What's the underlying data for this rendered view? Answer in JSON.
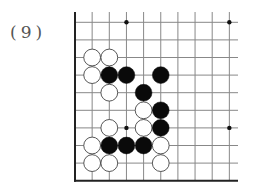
{
  "problem": {
    "label": "(9)"
  },
  "board": {
    "origin_x": 75,
    "origin_y": 22.3,
    "spacing_x": 17.15,
    "spacing_y": 17.6,
    "cols": 10,
    "rows": 10,
    "line_top": 12,
    "line_right": 238,
    "edges": [
      "left",
      "bottom"
    ],
    "line_color": "#888888",
    "edge_color": "#222222",
    "star_points": [
      {
        "col": 3,
        "row": 0
      },
      {
        "col": 9,
        "row": 0
      },
      {
        "col": 3,
        "row": 6
      },
      {
        "col": 9,
        "row": 6
      }
    ],
    "stones": [
      {
        "color": "white",
        "col": 1,
        "row": 2
      },
      {
        "color": "white",
        "col": 2,
        "row": 2
      },
      {
        "color": "white",
        "col": 1,
        "row": 3
      },
      {
        "color": "black",
        "col": 2,
        "row": 3
      },
      {
        "color": "black",
        "col": 3,
        "row": 3
      },
      {
        "color": "black",
        "col": 5,
        "row": 3
      },
      {
        "color": "white",
        "col": 2,
        "row": 4
      },
      {
        "color": "black",
        "col": 4,
        "row": 4
      },
      {
        "color": "white",
        "col": 4,
        "row": 5
      },
      {
        "color": "black",
        "col": 5,
        "row": 5
      },
      {
        "color": "white",
        "col": 2,
        "row": 6
      },
      {
        "color": "white",
        "col": 4,
        "row": 6
      },
      {
        "color": "black",
        "col": 5,
        "row": 6
      },
      {
        "color": "white",
        "col": 1,
        "row": 7
      },
      {
        "color": "black",
        "col": 2,
        "row": 7
      },
      {
        "color": "black",
        "col": 3,
        "row": 7
      },
      {
        "color": "black",
        "col": 4,
        "row": 7
      },
      {
        "color": "white",
        "col": 5,
        "row": 7
      },
      {
        "color": "white",
        "col": 1,
        "row": 8
      },
      {
        "color": "white",
        "col": 2,
        "row": 8
      },
      {
        "color": "white",
        "col": 5,
        "row": 8
      }
    ]
  }
}
